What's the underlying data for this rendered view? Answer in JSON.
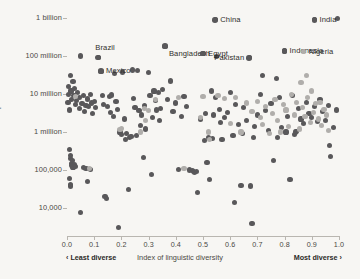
{
  "chart_data": {
    "type": "scatter",
    "title": "",
    "xlabel": "Index of linguistic diversity",
    "ylabel": "Population",
    "xlim": [
      0.0,
      1.0
    ],
    "ylim_log": [
      10000,
      1000000000
    ],
    "y_scale": "log",
    "grid": false,
    "background_color": "#f7f6f3",
    "axis_color": "#b9b6b0",
    "x_ticks": [
      "0.0",
      "0.1",
      "0.2",
      "0.3",
      "0.4",
      "0.5",
      "0.6",
      "0.7",
      "0.8",
      "0.9",
      "1.0"
    ],
    "x_tick_values": [
      0.0,
      0.1,
      0.2,
      0.3,
      0.4,
      0.5,
      0.6,
      0.7,
      0.8,
      0.9,
      1.0
    ],
    "y_ticks": [
      "1 billion",
      "100 million",
      "10 million",
      "1 million",
      "100,000",
      "10,000"
    ],
    "y_tick_values": [
      1000000000,
      100000000,
      10000000,
      1000000,
      100000,
      10000
    ],
    "x_axis_left_note": "‹ Least diverse",
    "x_axis_right_note": "Most diverse ›",
    "series": [
      {
        "name": "dark",
        "color": "#59585a",
        "marker_size": 5.2,
        "points": [
          [
            0.005,
            9500000
          ],
          [
            0.004,
            6000000
          ],
          [
            0.006,
            16000000
          ],
          [
            0.012,
            30000000
          ],
          [
            0.015,
            12000000
          ],
          [
            0.018,
            7000000
          ],
          [
            0.01,
            3800000
          ],
          [
            0.022,
            21000000
          ],
          [
            0.026,
            9000000
          ],
          [
            0.03,
            5200000
          ],
          [
            0.028,
            14000000
          ],
          [
            0.035,
            6800000
          ],
          [
            0.04,
            11000000
          ],
          [
            0.045,
            4200000
          ],
          [
            0.05,
            100000000
          ],
          [
            0.047,
            8000000
          ],
          [
            0.055,
            5600000
          ],
          [
            0.06,
            9200000
          ],
          [
            0.065,
            3400000
          ],
          [
            0.07,
            5000000
          ],
          [
            0.075,
            7400000
          ],
          [
            0.08,
            4600000
          ],
          [
            0.085,
            9800000
          ],
          [
            0.09,
            5800000
          ],
          [
            0.095,
            3000000
          ],
          [
            0.1,
            6400000
          ],
          [
            0.105,
            4400000
          ],
          [
            0.008,
            350000
          ],
          [
            0.012,
            240000
          ],
          [
            0.014,
            200000
          ],
          [
            0.016,
            150000
          ],
          [
            0.02,
            175000
          ],
          [
            0.018,
            130000
          ],
          [
            0.022,
            120000
          ],
          [
            0.01,
            60000
          ],
          [
            0.012,
            42000
          ],
          [
            0.013,
            38000
          ],
          [
            0.028,
            140000
          ],
          [
            0.032,
            125000
          ],
          [
            0.05,
            7500
          ],
          [
            0.06,
            115000
          ],
          [
            0.07,
            110000
          ],
          [
            0.075,
            50000
          ],
          [
            0.085,
            105000
          ],
          [
            0.115,
            92000000
          ],
          [
            0.125,
            40000000
          ],
          [
            0.13,
            9000000
          ],
          [
            0.135,
            5400000
          ],
          [
            0.14,
            20000
          ],
          [
            0.145,
            18000
          ],
          [
            0.15,
            4800000
          ],
          [
            0.155,
            8600000
          ],
          [
            0.16,
            3200000
          ],
          [
            0.165,
            9400000
          ],
          [
            0.17,
            2600000
          ],
          [
            0.175,
            35000000
          ],
          [
            0.18,
            6200000
          ],
          [
            0.185,
            4000000
          ],
          [
            0.19,
            3000
          ],
          [
            0.195,
            1000000
          ],
          [
            0.2,
            850000
          ],
          [
            0.205,
            38000000
          ],
          [
            0.21,
            2200000
          ],
          [
            0.215,
            650000
          ],
          [
            0.22,
            900000
          ],
          [
            0.225,
            30000
          ],
          [
            0.23,
            700000
          ],
          [
            0.235,
            750000
          ],
          [
            0.24,
            43000000
          ],
          [
            0.245,
            7800000
          ],
          [
            0.25,
            4500000
          ],
          [
            0.255,
            800000
          ],
          [
            0.26,
            42000000
          ],
          [
            0.265,
            3600000
          ],
          [
            0.27,
            1500000
          ],
          [
            0.275,
            2800000
          ],
          [
            0.28,
            210000
          ],
          [
            0.285,
            5000000
          ],
          [
            0.29,
            1200000
          ],
          [
            0.3,
            36000000
          ],
          [
            0.305,
            9000000
          ],
          [
            0.31,
            75000
          ],
          [
            0.315,
            2400000
          ],
          [
            0.32,
            12000000
          ],
          [
            0.325,
            6600000
          ],
          [
            0.33,
            3800000
          ],
          [
            0.335,
            11000000
          ],
          [
            0.34,
            2000000
          ],
          [
            0.345,
            4200000
          ],
          [
            0.35,
            13000000
          ],
          [
            0.36,
            180000000
          ],
          [
            0.37,
            7200000
          ],
          [
            0.38,
            22000000
          ],
          [
            0.39,
            3400000
          ],
          [
            0.4,
            5800000
          ],
          [
            0.41,
            105000
          ],
          [
            0.42,
            2600000
          ],
          [
            0.43,
            8400000
          ],
          [
            0.44,
            4600000
          ],
          [
            0.45,
            100000
          ],
          [
            0.46,
            95000
          ],
          [
            0.465,
            92000
          ],
          [
            0.47,
            88000
          ],
          [
            0.475,
            90000
          ],
          [
            0.48,
            25000
          ],
          [
            0.49,
            2200000
          ],
          [
            0.5,
            115000000
          ],
          [
            0.505,
            600000
          ],
          [
            0.51,
            3000000
          ],
          [
            0.515,
            160000
          ],
          [
            0.52,
            700000
          ],
          [
            0.525,
            55000
          ],
          [
            0.53,
            12000000
          ],
          [
            0.535,
            680000
          ],
          [
            0.54,
            2800000
          ],
          [
            0.545,
            8000000
          ],
          [
            0.55,
            95000000
          ],
          [
            0.56,
            4000000
          ],
          [
            0.565,
            1800000
          ],
          [
            0.57,
            640000
          ],
          [
            0.58,
            2400000
          ],
          [
            0.59,
            3200000
          ],
          [
            0.6,
            11000000
          ],
          [
            0.61,
            800000
          ],
          [
            0.615,
            14000
          ],
          [
            0.62,
            5200000
          ],
          [
            0.63,
            1600000
          ],
          [
            0.64,
            40000
          ],
          [
            0.645,
            900000
          ],
          [
            0.65,
            4400000
          ],
          [
            0.66,
            2000000
          ],
          [
            0.67,
            90000000
          ],
          [
            0.675,
            38000
          ],
          [
            0.68,
            4000
          ],
          [
            0.685,
            700000
          ],
          [
            0.69,
            1400000
          ],
          [
            0.7,
            2800000
          ],
          [
            0.71,
            9500000
          ],
          [
            0.72,
            30000000
          ],
          [
            0.73,
            3600000
          ],
          [
            0.74,
            1100000
          ],
          [
            0.75,
            5500000
          ],
          [
            0.76,
            180000
          ],
          [
            0.77,
            25000000
          ],
          [
            0.775,
            700000
          ],
          [
            0.78,
            8000000
          ],
          [
            0.79,
            1300000
          ],
          [
            0.8,
            135000000
          ],
          [
            0.805,
            1000000
          ],
          [
            0.81,
            2600000
          ],
          [
            0.82,
            55000
          ],
          [
            0.83,
            9000000
          ],
          [
            0.835,
            850000
          ],
          [
            0.84,
            1000000
          ],
          [
            0.845,
            1050000
          ],
          [
            0.85,
            4200000
          ],
          [
            0.86,
            2200000
          ],
          [
            0.87,
            1700000
          ],
          [
            0.88,
            6000000
          ],
          [
            0.89,
            3000000
          ],
          [
            0.9,
            2400000
          ],
          [
            0.91,
            4800000
          ],
          [
            0.92,
            1900000
          ],
          [
            0.93,
            7000000
          ],
          [
            0.94,
            3400000
          ],
          [
            0.95,
            2000000
          ],
          [
            0.96,
            5000000
          ],
          [
            0.965,
            450000
          ],
          [
            0.97,
            230000
          ],
          [
            0.98,
            1300000
          ],
          [
            0.99,
            3800000
          ],
          [
            0.995,
            960000000
          ],
          [
            0.545,
            900000000
          ],
          [
            0.91,
            900000000
          ]
        ]
      },
      {
        "name": "light",
        "color": "#b0aeab",
        "marker_size": 5.2,
        "points": [
          [
            0.032,
            8800000
          ],
          [
            0.082,
            110000
          ],
          [
            0.195,
            1150000
          ],
          [
            0.2,
            1250000
          ],
          [
            0.27,
            1000000
          ],
          [
            0.285,
            4200000
          ],
          [
            0.29,
            2000000
          ],
          [
            0.3,
            3600000
          ],
          [
            0.325,
            7000000
          ],
          [
            0.41,
            8000000
          ],
          [
            0.43,
            110000
          ],
          [
            0.49,
            2400000
          ],
          [
            0.5,
            8600000
          ],
          [
            0.52,
            1000000
          ],
          [
            0.525,
            640000
          ],
          [
            0.555,
            9000000
          ],
          [
            0.58,
            7600000
          ],
          [
            0.6,
            1700000
          ],
          [
            0.62,
            8200000
          ],
          [
            0.64,
            1000000
          ],
          [
            0.66,
            5800000
          ],
          [
            0.68,
            3400000
          ],
          [
            0.7,
            6400000
          ],
          [
            0.71,
            2400000
          ],
          [
            0.72,
            1600000
          ],
          [
            0.73,
            4800000
          ],
          [
            0.745,
            900000
          ],
          [
            0.755,
            3000000
          ],
          [
            0.765,
            7000000
          ],
          [
            0.775,
            2000000
          ],
          [
            0.785,
            1000000
          ],
          [
            0.795,
            5200000
          ],
          [
            0.805,
            3800000
          ],
          [
            0.815,
            1400000
          ],
          [
            0.825,
            9800000
          ],
          [
            0.835,
            2800000
          ],
          [
            0.845,
            6000000
          ],
          [
            0.855,
            1200000
          ],
          [
            0.865,
            4400000
          ],
          [
            0.875,
            2600000
          ],
          [
            0.885,
            8000000
          ],
          [
            0.895,
            1800000
          ],
          [
            0.905,
            3200000
          ],
          [
            0.915,
            5600000
          ],
          [
            0.925,
            2200000
          ],
          [
            0.935,
            1500000
          ],
          [
            0.945,
            4000000
          ],
          [
            0.955,
            2800000
          ],
          [
            0.87,
            130000000
          ],
          [
            0.88,
            30000000
          ],
          [
            0.86,
            20000000
          ],
          [
            0.9,
            12000000
          ],
          [
            0.93,
            6000000
          ],
          [
            0.96,
            1100000
          ]
        ]
      }
    ],
    "annotations": [
      {
        "label": "China",
        "x": 0.545,
        "y": 900000000,
        "dot_color": "#59585a",
        "label_side": "right"
      },
      {
        "label": "India",
        "x": 0.91,
        "y": 900000000,
        "dot_color": "#59585a",
        "label_side": "right"
      },
      {
        "label": "Brazil",
        "x": 0.115,
        "y": 92000000,
        "dot_color": "#59585a",
        "label_side": "above"
      },
      {
        "label": "Mexico",
        "x": 0.125,
        "y": 40000000,
        "dot_color": "#59585a",
        "label_side": "right"
      },
      {
        "label": "Bangladesh",
        "x": 0.36,
        "y": 180000000,
        "dot_color": "#59585a",
        "label_side": "below-right"
      },
      {
        "label": "Egypt",
        "x": 0.5,
        "y": 115000000,
        "dot_color": "#59585a",
        "label_side": "right"
      },
      {
        "label": "Pakistan",
        "x": 0.67,
        "y": 90000000,
        "dot_color": "#59585a",
        "label_side": "left"
      },
      {
        "label": "Indonesia",
        "x": 0.8,
        "y": 135000000,
        "dot_color": "#59585a",
        "label_side": "right"
      },
      {
        "label": "Nigeria",
        "x": 0.87,
        "y": 130000000,
        "dot_color": "#b0aeab",
        "label_side": "right"
      }
    ]
  }
}
